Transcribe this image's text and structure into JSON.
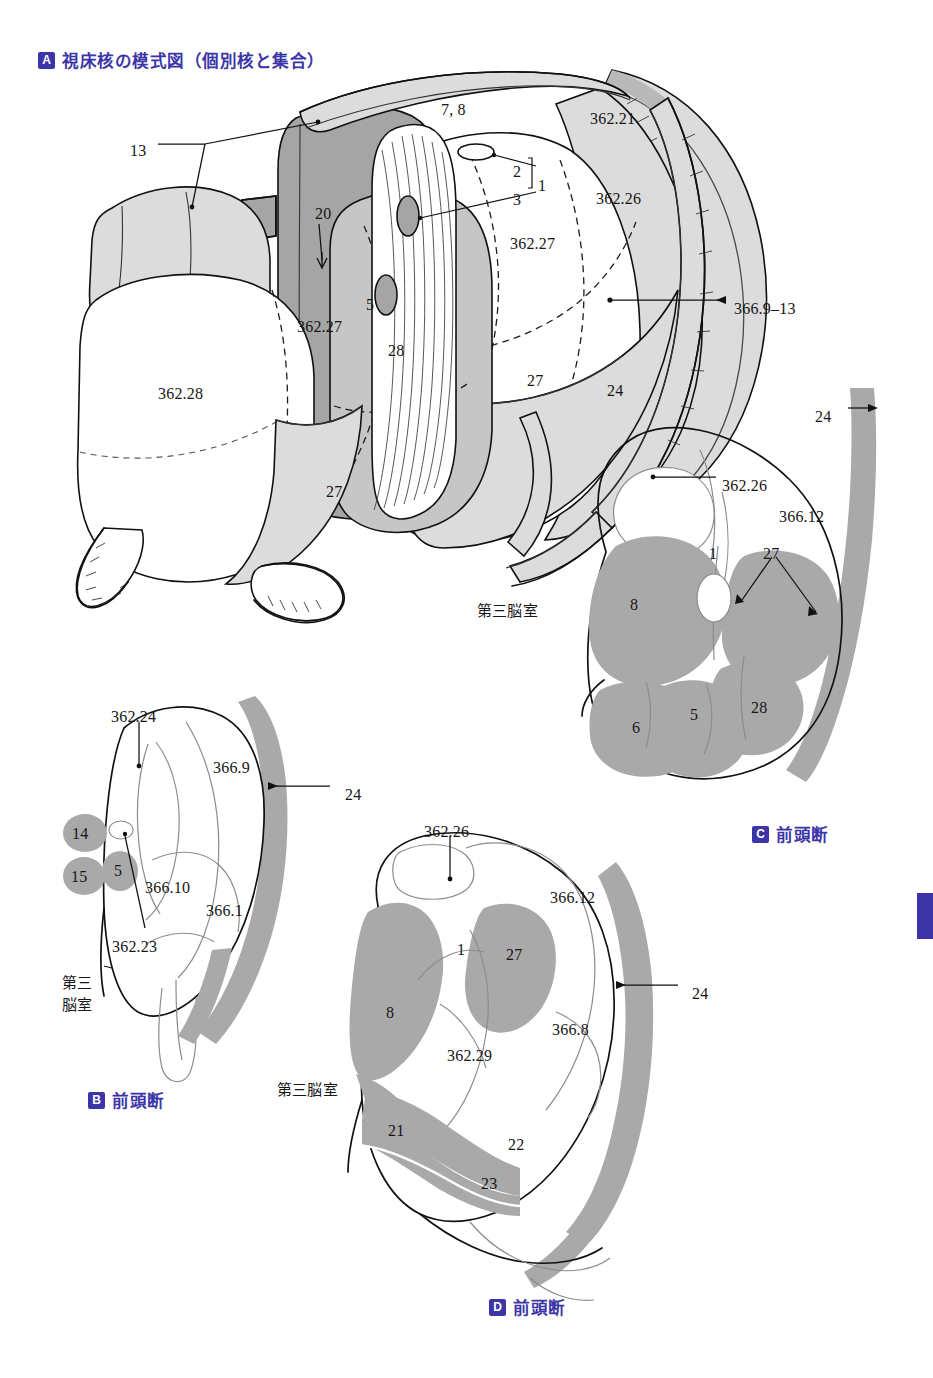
{
  "page": {
    "width": 933,
    "height": 1378,
    "accent_color": "#3b35a8",
    "background": "#ffffff",
    "thumb_tab_color": "#3b35a8"
  },
  "panels": [
    {
      "id": "A",
      "badge": "A",
      "caption": "視床核の模式図（個別核と集合）"
    },
    {
      "id": "B",
      "badge": "B",
      "caption": "前頭断"
    },
    {
      "id": "C",
      "badge": "C",
      "caption": "前頭断"
    },
    {
      "id": "D",
      "badge": "D",
      "caption": "前頭断"
    }
  ],
  "panel_a": {
    "labels": [
      {
        "text": "13",
        "x": 130,
        "y": 142
      },
      {
        "text": "7, 8",
        "x": 441,
        "y": 101
      },
      {
        "text": "362.21",
        "x": 590,
        "y": 110
      },
      {
        "text": "2",
        "x": 513,
        "y": 163
      },
      {
        "text": "3",
        "x": 513,
        "y": 191
      },
      {
        "text": "1",
        "x": 538,
        "y": 177
      },
      {
        "text": "362.26",
        "x": 596,
        "y": 190
      },
      {
        "text": "20",
        "x": 315,
        "y": 205
      },
      {
        "text": "362.27",
        "x": 510,
        "y": 235
      },
      {
        "text": "5",
        "x": 366,
        "y": 296
      },
      {
        "text": "366.9–13",
        "x": 734,
        "y": 300
      },
      {
        "text": "362.27",
        "x": 297,
        "y": 318
      },
      {
        "text": "28",
        "x": 388,
        "y": 342
      },
      {
        "text": "362.28",
        "x": 158,
        "y": 385
      },
      {
        "text": "27",
        "x": 527,
        "y": 372
      },
      {
        "text": "24",
        "x": 607,
        "y": 382
      },
      {
        "text": "27",
        "x": 326,
        "y": 483
      }
    ]
  },
  "panel_b": {
    "labels": [
      {
        "text": "362.24",
        "x": 111,
        "y": 708
      },
      {
        "text": "366.9",
        "x": 213,
        "y": 759
      },
      {
        "text": "24",
        "x": 345,
        "y": 786
      },
      {
        "text": "14",
        "x": 80,
        "y": 834
      },
      {
        "text": "15",
        "x": 80,
        "y": 876
      },
      {
        "text": "5",
        "x": 118,
        "y": 871
      },
      {
        "text": "366.10",
        "x": 161,
        "y": 879
      },
      {
        "text": "366.1",
        "x": 216,
        "y": 902
      },
      {
        "text": "362.23",
        "x": 112,
        "y": 938
      },
      {
        "text": "第三",
        "x": 62,
        "y": 976
      },
      {
        "text": "脳室",
        "x": 62,
        "y": 998
      }
    ]
  },
  "panel_c": {
    "labels": [
      {
        "text": "24",
        "x": 815,
        "y": 408
      },
      {
        "text": "362.26",
        "x": 722,
        "y": 477
      },
      {
        "text": "366.12",
        "x": 779,
        "y": 508
      },
      {
        "text": "1",
        "x": 709,
        "y": 545
      },
      {
        "text": "27",
        "x": 763,
        "y": 545
      },
      {
        "text": "8",
        "x": 630,
        "y": 596
      },
      {
        "text": "第三脳室",
        "x": 477,
        "y": 602
      },
      {
        "text": "6",
        "x": 632,
        "y": 719
      },
      {
        "text": "5",
        "x": 690,
        "y": 706
      },
      {
        "text": "28",
        "x": 751,
        "y": 699
      }
    ]
  },
  "panel_d": {
    "labels": [
      {
        "text": "362.26",
        "x": 424,
        "y": 823
      },
      {
        "text": "366.12",
        "x": 550,
        "y": 889
      },
      {
        "text": "1",
        "x": 457,
        "y": 941
      },
      {
        "text": "27",
        "x": 506,
        "y": 946
      },
      {
        "text": "24",
        "x": 692,
        "y": 985
      },
      {
        "text": "8",
        "x": 386,
        "y": 1004
      },
      {
        "text": "366.8",
        "x": 552,
        "y": 1021
      },
      {
        "text": "362.29",
        "x": 447,
        "y": 1047
      },
      {
        "text": "第三脳室",
        "x": 277,
        "y": 1081
      },
      {
        "text": "21",
        "x": 388,
        "y": 1122
      },
      {
        "text": "22",
        "x": 508,
        "y": 1136
      },
      {
        "text": "23",
        "x": 481,
        "y": 1175
      }
    ]
  }
}
